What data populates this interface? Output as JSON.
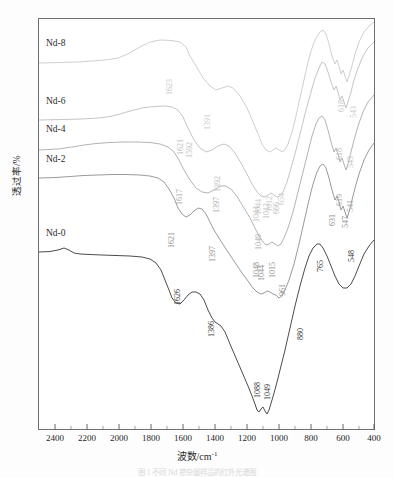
{
  "figure": {
    "caption": "图 1  不同 Nd 掺杂量样品的红外光谱图"
  },
  "axes": {
    "x": {
      "label_text": "波数/cm",
      "label_sup": "-1",
      "ticks": [
        "2400",
        "2200",
        "2000",
        "1800",
        "1600",
        "1400",
        "1200",
        "1000",
        "800",
        "600",
        "400"
      ],
      "min": 2500,
      "max": 400
    },
    "y": {
      "label": "透过率/%"
    }
  },
  "chart_data": {
    "type": "line",
    "title": "",
    "xlabel": "波数/cm-1",
    "ylabel": "透过率/%",
    "xlim": [
      2500,
      400
    ],
    "ylim": [
      0,
      100
    ],
    "grid": false,
    "legend": "inline-curve-labels",
    "x_ticks": [
      2400,
      2200,
      2000,
      1800,
      1600,
      1400,
      1200,
      1000,
      800,
      600,
      400
    ],
    "series": [
      {
        "name": "Nd-8",
        "color": "#c9c9c9",
        "label_x": 46,
        "label_y": 38,
        "peaks": [
          {
            "value": "1623",
            "x": 165,
            "y": 95
          },
          {
            "value": "1391",
            "x": 203,
            "y": 130
          },
          {
            "value": "1044",
            "x": 254,
            "y": 215
          },
          {
            "value": "1012",
            "x": 265,
            "y": 212
          },
          {
            "value": "654",
            "x": 277,
            "y": 205
          },
          {
            "value": "618",
            "x": 337,
            "y": 112
          },
          {
            "value": "543",
            "x": 349,
            "y": 118
          }
        ]
      },
      {
        "name": "Nd-6",
        "color": "#bdbdbd",
        "label_x": 46,
        "label_y": 96,
        "peaks": [
          {
            "value": "1621",
            "x": 176,
            "y": 155
          },
          {
            "value": "1592",
            "x": 185,
            "y": 158
          },
          {
            "value": "1392",
            "x": 213,
            "y": 192
          },
          {
            "value": "1044",
            "x": 252,
            "y": 222
          },
          {
            "value": "1012",
            "x": 262,
            "y": 219
          },
          {
            "value": "666",
            "x": 272,
            "y": 214
          },
          {
            "value": "618",
            "x": 335,
            "y": 160
          },
          {
            "value": "543",
            "x": 346,
            "y": 168
          }
        ]
      },
      {
        "name": "Nd-4",
        "color": "#aaaaaa",
        "label_x": 46,
        "label_y": 124,
        "peaks": [
          {
            "value": "1617",
            "x": 175,
            "y": 205
          },
          {
            "value": "1397",
            "x": 212,
            "y": 213
          },
          {
            "value": "1049",
            "x": 254,
            "y": 250
          },
          {
            "value": "619",
            "x": 335,
            "y": 206
          },
          {
            "value": "541",
            "x": 346,
            "y": 212
          }
        ]
      },
      {
        "name": "Nd-2",
        "color": "#8f8f8f",
        "label_x": 46,
        "label_y": 154,
        "peaks": [
          {
            "value": "1621",
            "x": 167,
            "y": 248
          },
          {
            "value": "1397",
            "x": 208,
            "y": 262
          },
          {
            "value": "1048",
            "x": 252,
            "y": 278
          },
          {
            "value": "1044",
            "x": 257,
            "y": 281
          },
          {
            "value": "1015",
            "x": 268,
            "y": 278
          },
          {
            "value": "961",
            "x": 278,
            "y": 296
          },
          {
            "value": "631",
            "x": 328,
            "y": 226
          },
          {
            "value": "547",
            "x": 341,
            "y": 228
          }
        ]
      },
      {
        "name": "Nd-0",
        "color": "#4c4c4c",
        "label_x": 46,
        "label_y": 228,
        "peaks": [
          {
            "value": "1626",
            "x": 173,
            "y": 305
          },
          {
            "value": "1386",
            "x": 207,
            "y": 337
          },
          {
            "value": "1088",
            "x": 253,
            "y": 398
          },
          {
            "value": "1049",
            "x": 263,
            "y": 400
          },
          {
            "value": "880",
            "x": 296,
            "y": 340
          },
          {
            "value": "765",
            "x": 316,
            "y": 272
          },
          {
            "value": "548",
            "x": 347,
            "y": 262
          }
        ]
      }
    ]
  }
}
